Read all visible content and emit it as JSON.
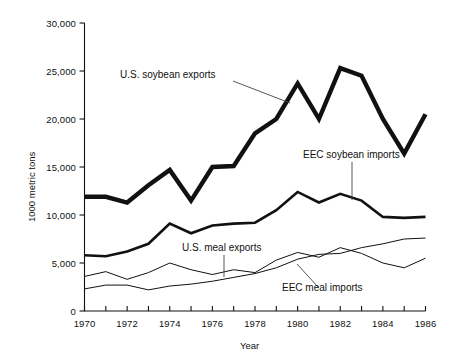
{
  "chart_data": {
    "type": "line",
    "title": "",
    "xlabel": "Year",
    "ylabel": "1000 metric tons",
    "xlim": [
      1970,
      1986
    ],
    "ylim": [
      0,
      30000
    ],
    "grid": false,
    "legend_position": "inline-annotations",
    "x": [
      1970,
      1971,
      1972,
      1973,
      1974,
      1975,
      1976,
      1977,
      1978,
      1979,
      1980,
      1981,
      1982,
      1983,
      1984,
      1985,
      1986
    ],
    "xticks": [
      "1970",
      "",
      "1972",
      "",
      "1974",
      "",
      "1976",
      "",
      "1978",
      "",
      "1980",
      "",
      "1982",
      "",
      "1984",
      "",
      "1986"
    ],
    "ytick_labels": [
      "0",
      "5,000",
      "10,000",
      "15,000",
      "20,000",
      "25,000",
      "30,000"
    ],
    "ytick_values": [
      0,
      5000,
      10000,
      15000,
      20000,
      25000,
      30000
    ],
    "series": [
      {
        "name": "U.S. soybean exports",
        "stroke_width": 4.4,
        "color": "#111111",
        "values": [
          11900,
          11900,
          11300,
          13100,
          14700,
          11500,
          15000,
          15100,
          18500,
          20000,
          23700,
          20000,
          25300,
          24500,
          20000,
          16400,
          20500
        ]
      },
      {
        "name": "EEC soybean imports",
        "stroke_width": 2.6,
        "color": "#111111",
        "values": [
          5800,
          5700,
          6200,
          7000,
          9100,
          8100,
          8900,
          9100,
          9200,
          10500,
          12400,
          11300,
          12200,
          11500,
          9800,
          9700,
          9800
        ]
      },
      {
        "name": "U.S. meal exports",
        "stroke_width": 1.0,
        "color": "#111111",
        "values": [
          3600,
          4100,
          3300,
          4000,
          5000,
          4300,
          3800,
          4300,
          4000,
          5300,
          6100,
          5600,
          6600,
          6000,
          5000,
          4500,
          5500
        ]
      },
      {
        "name": "EEC meal imports",
        "stroke_width": 1.0,
        "color": "#111111",
        "values": [
          2300,
          2700,
          2700,
          2200,
          2600,
          2800,
          3100,
          3500,
          3900,
          4500,
          5400,
          5900,
          6000,
          6600,
          7000,
          7500,
          7600
        ]
      }
    ],
    "annotations": [
      {
        "name": "us-soybean-exports",
        "text": "U.S. soybean exports",
        "label_x": 120,
        "label_y": 76,
        "leader": [
          [
            233,
            81
          ],
          [
            290,
            103
          ]
        ]
      },
      {
        "name": "eec-soybean-imports",
        "text": "EEC soybean imports",
        "label_x": 303,
        "label_y": 156,
        "leader": [
          [
            352,
            162
          ],
          [
            352,
            200
          ]
        ]
      },
      {
        "name": "us-meal-exports",
        "text": "U.S. meal exports",
        "label_x": 182,
        "label_y": 249,
        "leader": [
          [
            224,
            255
          ],
          [
            224,
            277
          ]
        ]
      },
      {
        "name": "eec-meal-imports",
        "text": "EEC meal imports",
        "label_x": 282,
        "label_y": 289,
        "leader": [
          [
            318,
            287
          ],
          [
            297,
            264
          ]
        ]
      }
    ]
  },
  "axes": {
    "x_axis_title": "Year",
    "y_axis_title": "1000 metric tons"
  }
}
